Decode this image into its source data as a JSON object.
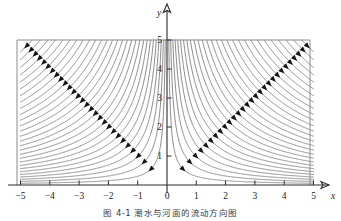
{
  "figure": {
    "caption": "图 4-1    潮水与河面的流动方向图",
    "axes": {
      "x_name": "x",
      "y_name": "y",
      "x_ticks": [
        {
          "value": -5,
          "label": "−5"
        },
        {
          "value": -4,
          "label": "−4"
        },
        {
          "value": -3,
          "label": "−3"
        },
        {
          "value": -2,
          "label": "−2"
        },
        {
          "value": -1,
          "label": "−1"
        },
        {
          "value": 0,
          "label": "0"
        },
        {
          "value": 1,
          "label": "1"
        },
        {
          "value": 2,
          "label": "2"
        },
        {
          "value": 3,
          "label": "3"
        },
        {
          "value": 4,
          "label": "4"
        },
        {
          "value": 5,
          "label": "5"
        }
      ],
      "y_ticks": [
        {
          "value": 1,
          "label": "1"
        },
        {
          "value": 2,
          "label": "2"
        },
        {
          "value": 3,
          "label": "3"
        },
        {
          "value": 4,
          "label": "4"
        },
        {
          "value": 5,
          "label": "5"
        }
      ],
      "xlim": [
        -5,
        5
      ],
      "ylim": [
        0,
        5
      ],
      "grid": false
    },
    "colors": {
      "curve": "#777777",
      "arrow": "#151515",
      "axis": "#2b2b2b",
      "frame": "#8a8a8a",
      "background": "#ffffff"
    }
  },
  "chart_data": {
    "type": "line",
    "title": "",
    "subtitle": "",
    "xlabel": "x",
    "ylabel": "y",
    "xlim": [
      -5,
      5
    ],
    "ylim": [
      0,
      5
    ],
    "grid": false,
    "legend": "none",
    "curve_family": "y = c / |x|",
    "c_values": [
      0.3,
      0.62,
      0.98,
      1.38,
      1.82,
      2.3,
      2.82,
      3.38,
      3.98,
      4.62,
      5.3,
      6.02,
      6.78,
      7.58,
      8.42,
      9.3,
      10.22,
      11.18,
      12.18,
      13.22,
      14.3,
      15.42,
      16.58,
      17.78,
      19.02,
      20.3,
      21.62,
      22.98
    ],
    "arrow_rule": "one arrowhead per curve placed where y = |x| = sqrt(c), pointing down-toward the origin",
    "mirrored": true,
    "series": [
      {
        "name": "left branch (x<0)",
        "values": "y = c/|x| for x in [-5, 0)"
      },
      {
        "name": "right branch (x>0)",
        "values": "y = c/x for x in (0, 5]"
      }
    ]
  }
}
